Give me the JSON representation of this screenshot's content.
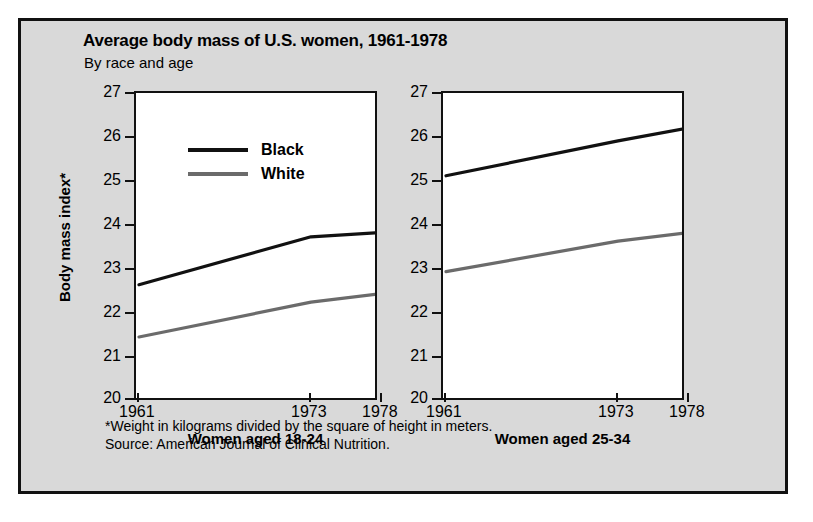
{
  "figure": {
    "title": "Average body mass of U.S. women, 1961-1978",
    "subtitle": "By race and age",
    "ylabel": "Body mass index*",
    "footnote": "*Weight in kilograms divided by the square of height in meters.",
    "source": "Source: American Journal of Clinical Nutrition."
  },
  "legend": {
    "items": [
      {
        "label": "Black",
        "color": "#111111"
      },
      {
        "label": "White",
        "color": "#6b6b6b"
      }
    ]
  },
  "axis": {
    "yticks": [
      "27",
      "26",
      "25",
      "24",
      "23",
      "22",
      "21",
      "20"
    ],
    "xticks": [
      "1961",
      "1973",
      "1978"
    ]
  },
  "colors": {
    "background": "#d9d9d9",
    "plot_background": "#ffffff",
    "border": "#111111",
    "black_series": "#111111",
    "white_series": "#6b6b6b"
  },
  "chart_data": [
    {
      "type": "line",
      "title": "Women aged 18-24",
      "xlabel": "",
      "ylabel": "Body mass index*",
      "x": [
        1961,
        1973,
        1978
      ],
      "xtick_labels": [
        "1961",
        "1973",
        "1978"
      ],
      "ylim": [
        20,
        27
      ],
      "ytick_labels": [
        "20",
        "21",
        "22",
        "23",
        "24",
        "25",
        "26",
        "27"
      ],
      "grid": false,
      "legend_position": "upper-left",
      "series": [
        {
          "name": "Black",
          "color": "#111111",
          "values": [
            22.6,
            23.7,
            23.8
          ]
        },
        {
          "name": "White",
          "color": "#6b6b6b",
          "values": [
            21.4,
            22.2,
            22.4
          ]
        }
      ]
    },
    {
      "type": "line",
      "title": "Women aged 25-34",
      "xlabel": "",
      "ylabel": "",
      "x": [
        1961,
        1973,
        1978
      ],
      "xtick_labels": [
        "1961",
        "1973",
        "1978"
      ],
      "ylim": [
        20,
        27
      ],
      "ytick_labels": [
        "20",
        "21",
        "22",
        "23",
        "24",
        "25",
        "26",
        "27"
      ],
      "grid": false,
      "legend_position": "none",
      "series": [
        {
          "name": "Black",
          "color": "#111111",
          "values": [
            25.1,
            25.9,
            26.2
          ]
        },
        {
          "name": "White",
          "color": "#6b6b6b",
          "values": [
            22.9,
            23.6,
            23.8
          ]
        }
      ]
    }
  ]
}
